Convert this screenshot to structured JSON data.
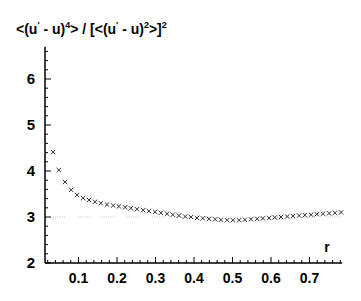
{
  "chart_data": {
    "type": "scatter",
    "title_parts": {
      "a": "<(u",
      "prime": "'",
      "b": " - u)",
      "exp1": "4",
      "c": "> / [<(u",
      "prime2": "'",
      "d": " - u)",
      "exp2": "2",
      "e": ">]",
      "exp3": "2"
    },
    "xlabel": "r",
    "ylabel": "<(u' - u)^4> / [<(u' - u)^2>]^2",
    "xlim": [
      0.013,
      0.785
    ],
    "ylim": [
      2,
      6.7
    ],
    "xticks": [
      0.1,
      0.2,
      0.3,
      0.4,
      0.5,
      0.6,
      0.7
    ],
    "xtick_labels": [
      "0.1",
      "0.2",
      "0.3",
      "0.4",
      "0.5",
      "0.6",
      "0.7"
    ],
    "yticks": [
      2,
      3,
      4,
      5,
      6
    ],
    "ytick_labels": [
      "2",
      "3",
      "4",
      "5",
      "6"
    ],
    "grid": false,
    "legend": null,
    "series": [
      {
        "name": "flatness",
        "marker": "x",
        "color": "#333333",
        "x": [
          0.034,
          0.049,
          0.065,
          0.081,
          0.096,
          0.112,
          0.127,
          0.143,
          0.158,
          0.174,
          0.19,
          0.205,
          0.221,
          0.236,
          0.252,
          0.268,
          0.283,
          0.299,
          0.314,
          0.33,
          0.345,
          0.361,
          0.377,
          0.392,
          0.408,
          0.423,
          0.439,
          0.455,
          0.47,
          0.486,
          0.501,
          0.517,
          0.532,
          0.548,
          0.564,
          0.579,
          0.595,
          0.61,
          0.626,
          0.642,
          0.657,
          0.673,
          0.688,
          0.704,
          0.719,
          0.735,
          0.751,
          0.766,
          0.782
        ],
        "y": [
          4.41,
          4.02,
          3.76,
          3.59,
          3.48,
          3.41,
          3.37,
          3.33,
          3.3,
          3.27,
          3.25,
          3.23,
          3.21,
          3.19,
          3.17,
          3.15,
          3.13,
          3.11,
          3.09,
          3.07,
          3.05,
          3.03,
          3.01,
          3.0,
          2.98,
          2.97,
          2.96,
          2.95,
          2.94,
          2.93,
          2.93,
          2.93,
          2.94,
          2.95,
          2.96,
          2.97,
          2.98,
          2.99,
          3.0,
          3.01,
          3.02,
          3.03,
          3.04,
          3.05,
          3.06,
          3.07,
          3.08,
          3.09,
          3.1
        ]
      },
      {
        "name": "gaussian-reference",
        "marker": "dot",
        "color": "#bbbbbb",
        "x_range": [
          0.034,
          0.782
        ],
        "y_const": 3.0
      }
    ]
  }
}
